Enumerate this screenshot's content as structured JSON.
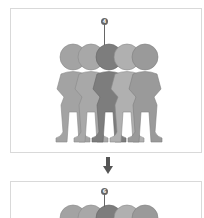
{
  "diagram": {
    "top_panel": {
      "callout_label": "4",
      "figure_count": 5,
      "highlighted_index": 2,
      "figure_colors": [
        "#a3a3a3",
        "#a8a8a8",
        "#7d7d7d",
        "#b0b0b0",
        "#9a9a9a"
      ]
    },
    "arrow": {
      "direction": "down",
      "color": "#555555"
    },
    "bottom_panel": {
      "callout_label": "6",
      "figure_colors": [
        "#a3a3a3",
        "#a8a8a8",
        "#7d7d7d",
        "#b0b0b0",
        "#9a9a9a"
      ]
    }
  }
}
